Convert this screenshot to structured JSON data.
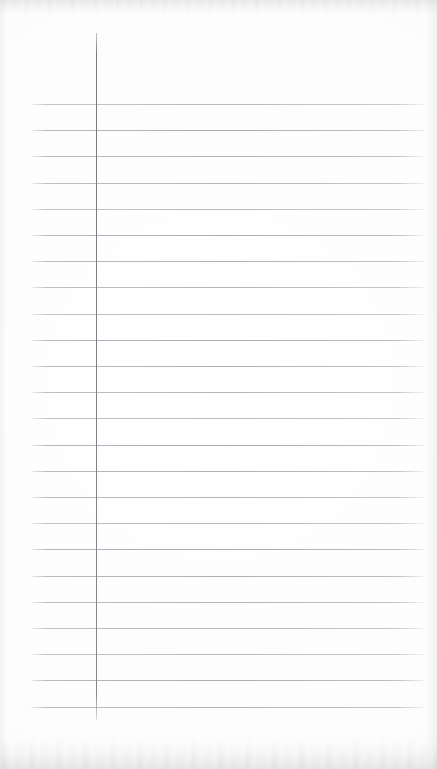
{
  "document": {
    "kind": "scanned-lined-paper",
    "title": "Blank Lined Notebook Page",
    "content_text": "",
    "page_width": 437,
    "page_height": 769,
    "background_color": "#fdfdfd",
    "has_handwriting": false,
    "has_printed_text": false
  },
  "ruling": {
    "horizontal_rule_color": "#a8abb1",
    "horizontal_rule_count": 24,
    "horizontal_rule_left": 31,
    "horizontal_rule_right": 424,
    "horizontal_rule_first_y": 104,
    "horizontal_rule_spacing": 26.2,
    "horizontal_rule_thickness": 1,
    "horizontal_rule_y_positions": [
      104,
      130.2,
      156.4,
      182.6,
      208.8,
      235,
      261.2,
      287.4,
      313.6,
      339.8,
      366,
      392.2,
      418.4,
      444.6,
      470.8,
      497,
      523.2,
      549.4,
      575.6,
      601.8,
      628,
      654.2,
      680.4,
      706.6
    ]
  },
  "margin": {
    "vertical_rule_color": "#7e8187",
    "vertical_rule_x": 96,
    "vertical_rule_top": 33,
    "vertical_rule_bottom": 720,
    "vertical_rule_thickness": 1
  },
  "scan_artifacts": {
    "top_edge_shadow_color": "#aaacb0",
    "bottom_edge_shadow_color": "#a8aaaf",
    "side_edge_shadow_color": "#c6c8cd"
  }
}
